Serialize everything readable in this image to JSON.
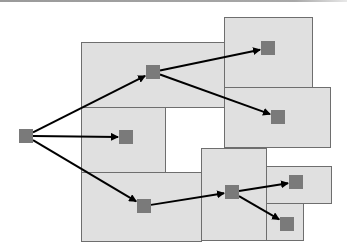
{
  "diagram": {
    "type": "hierarchical-partition-tree",
    "colors": {
      "background": "#ffffff",
      "box_fill": "#e0e0e0",
      "box_stroke": "#6e6e6e",
      "node_fill": "#7a7a7a",
      "edge": "#000000",
      "top_bar": "#a0a0a0"
    },
    "boxes": [
      {
        "id": "box-top-left",
        "x": 81,
        "y": 42,
        "w": 143,
        "h": 65
      },
      {
        "id": "box-middle-left",
        "x": 81,
        "y": 107,
        "w": 84,
        "h": 65
      },
      {
        "id": "box-bottom-left",
        "x": 81,
        "y": 172,
        "w": 120,
        "h": 69
      },
      {
        "id": "box-top-right",
        "x": 224,
        "y": 17,
        "w": 88,
        "h": 70
      },
      {
        "id": "box-middle-right",
        "x": 224,
        "y": 87,
        "w": 106,
        "h": 60
      },
      {
        "id": "box-bottom-center",
        "x": 201,
        "y": 148,
        "w": 65,
        "h": 92
      },
      {
        "id": "box-right-upper-small",
        "x": 266,
        "y": 166,
        "w": 65,
        "h": 37
      },
      {
        "id": "box-right-lower-small",
        "x": 266,
        "y": 203,
        "w": 37,
        "h": 37
      }
    ],
    "nodes": [
      {
        "id": "root",
        "x": 19,
        "y": 129,
        "size": 14
      },
      {
        "id": "n1",
        "x": 146,
        "y": 65,
        "size": 14
      },
      {
        "id": "n2",
        "x": 119,
        "y": 130,
        "size": 14
      },
      {
        "id": "n3",
        "x": 137,
        "y": 199,
        "size": 14
      },
      {
        "id": "n4",
        "x": 261,
        "y": 41,
        "size": 14
      },
      {
        "id": "n5",
        "x": 271,
        "y": 110,
        "size": 14
      },
      {
        "id": "n6",
        "x": 225,
        "y": 185,
        "size": 14
      },
      {
        "id": "n7",
        "x": 289,
        "y": 175,
        "size": 14
      },
      {
        "id": "n8",
        "x": 280,
        "y": 217,
        "size": 14
      }
    ],
    "edges": [
      {
        "from": "root",
        "to": "n1"
      },
      {
        "from": "root",
        "to": "n2"
      },
      {
        "from": "root",
        "to": "n3"
      },
      {
        "from": "n1",
        "to": "n4"
      },
      {
        "from": "n1",
        "to": "n5"
      },
      {
        "from": "n3",
        "to": "n6"
      },
      {
        "from": "n6",
        "to": "n7"
      },
      {
        "from": "n6",
        "to": "n8"
      }
    ]
  }
}
